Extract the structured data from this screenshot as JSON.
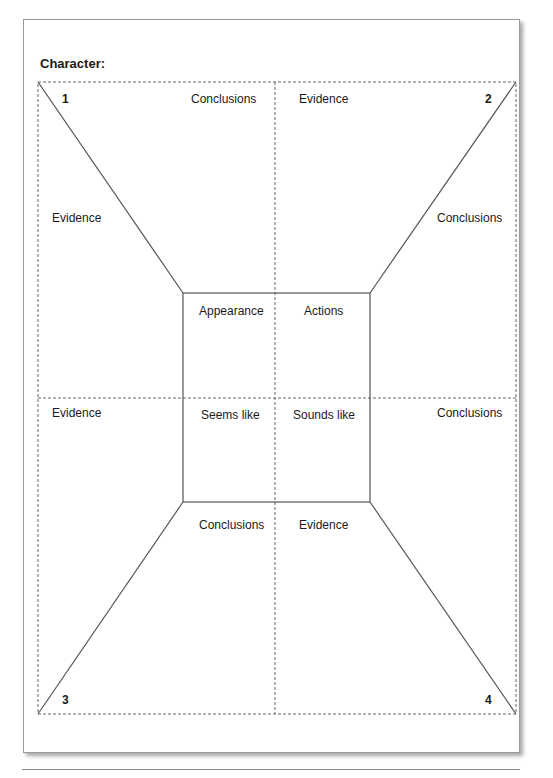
{
  "title": "Character:",
  "corners": {
    "n1": "1",
    "n2": "2",
    "n3": "3",
    "n4": "4"
  },
  "outer_labels": {
    "top_left_conclusions": "Conclusions",
    "top_right_evidence": "Evidence",
    "left_upper_evidence": "Evidence",
    "right_upper_conclusions": "Conclusions",
    "left_lower_evidence": "Evidence",
    "right_lower_conclusions": "Conclusions",
    "bottom_left_conclusions": "Conclusions",
    "bottom_right_evidence": "Evidence"
  },
  "center_labels": {
    "appearance": "Appearance",
    "actions": "Actions",
    "seems_like": "Seems like",
    "sounds_like": "Sounds like"
  }
}
